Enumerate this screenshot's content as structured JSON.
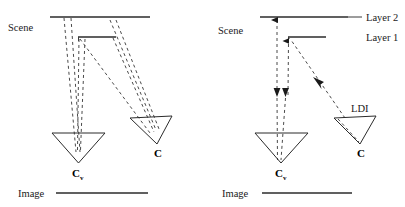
{
  "figure": {
    "background": "#ffffff",
    "ink": "#1a1a1a",
    "width": 405,
    "height": 207
  },
  "left_panel": {
    "name": "left-diagram",
    "labels": {
      "scene": "Scene",
      "image": "Image",
      "camera_virtual": "C",
      "camera_virtual_sub": "v",
      "camera_real": "C"
    }
  },
  "right_panel": {
    "name": "right-diagram",
    "labels": {
      "scene": "Scene",
      "image": "Image",
      "layer_2": "Layer 2",
      "layer_1": "Layer 1",
      "ldi": "LDI",
      "camera_virtual": "C",
      "camera_virtual_sub": "v",
      "camera_real": "C"
    }
  }
}
